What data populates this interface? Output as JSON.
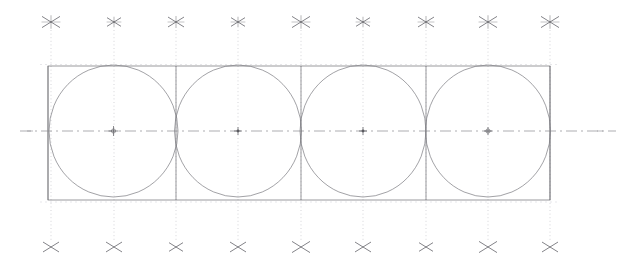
{
  "drawing": {
    "title": "Four Tangent Circles Construction Layout",
    "type": "technical-cad-drawing",
    "canvas": {
      "width": 634,
      "height": 264,
      "background": "#ffffff"
    },
    "colors": {
      "outline": "#6e6e72",
      "circle": "#7a7a80",
      "centerline": "#8a8a90",
      "construction": "#b9b9c0",
      "marker": "#5a5a60",
      "grid_faint": "#cfcfd4"
    },
    "frame": {
      "label": "bounding-rectangle",
      "x": 48,
      "y": 66,
      "width": 502,
      "height": 134,
      "stroke_width": 0.7
    },
    "centerline": {
      "label": "horizontal-axis",
      "y": 131,
      "x_start": 20,
      "x_end": 616,
      "style": "dash-dot",
      "stroke_width": 0.7
    },
    "circles": [
      {
        "label": "circle-1",
        "cx": 113.5,
        "cy": 131,
        "rx": 64.5,
        "ry": 66,
        "stroke_width": 0.7
      },
      {
        "label": "circle-2",
        "cx": 238.0,
        "cy": 131,
        "rx": 63.5,
        "ry": 66,
        "stroke_width": 0.7
      },
      {
        "label": "circle-3",
        "cx": 363.0,
        "cy": 131,
        "rx": 63.0,
        "ry": 66,
        "stroke_width": 0.7
      },
      {
        "label": "circle-4",
        "cx": 488.0,
        "cy": 131,
        "rx": 62.5,
        "ry": 66,
        "stroke_width": 0.7
      }
    ],
    "cell_dividers": [
      {
        "label": "divider-left-edge",
        "x": 48
      },
      {
        "label": "divider-1-2",
        "x": 176
      },
      {
        "label": "divider-2-3",
        "x": 301
      },
      {
        "label": "divider-3-4",
        "x": 426
      },
      {
        "label": "divider-right-edge",
        "x": 550
      }
    ],
    "construction_lines": [
      {
        "label": "construction-line-1",
        "x": 51,
        "y_top": 30,
        "y_bottom": 240,
        "style": "dotted"
      },
      {
        "label": "construction-line-2",
        "x": 114,
        "y_top": 30,
        "y_bottom": 240,
        "style": "dotted"
      },
      {
        "label": "construction-line-3",
        "x": 176,
        "y_top": 30,
        "y_bottom": 240,
        "style": "dotted"
      },
      {
        "label": "construction-line-4",
        "x": 238,
        "y_top": 30,
        "y_bottom": 240,
        "style": "dotted"
      },
      {
        "label": "construction-line-5",
        "x": 301,
        "y_top": 30,
        "y_bottom": 240,
        "style": "dotted"
      },
      {
        "label": "construction-line-6",
        "x": 363,
        "y_top": 30,
        "y_bottom": 240,
        "style": "dotted"
      },
      {
        "label": "construction-line-7",
        "x": 426,
        "y_top": 30,
        "y_bottom": 240,
        "style": "dotted"
      },
      {
        "label": "construction-line-8",
        "x": 488,
        "y_top": 30,
        "y_bottom": 240,
        "style": "dotted"
      },
      {
        "label": "construction-line-9",
        "x": 550,
        "y_top": 30,
        "y_bottom": 240,
        "style": "dotted"
      }
    ],
    "top_markers": [
      {
        "label": "top-marker-1",
        "x": 51,
        "y": 22,
        "size": 9
      },
      {
        "label": "top-marker-2",
        "x": 114,
        "y": 22,
        "size": 7
      },
      {
        "label": "top-marker-3",
        "x": 176,
        "y": 22,
        "size": 8
      },
      {
        "label": "top-marker-4",
        "x": 238,
        "y": 22,
        "size": 7
      },
      {
        "label": "top-marker-5",
        "x": 301,
        "y": 22,
        "size": 9
      },
      {
        "label": "top-marker-6",
        "x": 363,
        "y": 22,
        "size": 7
      },
      {
        "label": "top-marker-7",
        "x": 426,
        "y": 22,
        "size": 8
      },
      {
        "label": "top-marker-8",
        "x": 488,
        "y": 22,
        "size": 9
      },
      {
        "label": "top-marker-9",
        "x": 550,
        "y": 22,
        "size": 9
      }
    ],
    "bottom_markers": [
      {
        "label": "bottom-marker-1",
        "x": 51,
        "y": 247,
        "size": 8
      },
      {
        "label": "bottom-marker-2",
        "x": 114,
        "y": 247,
        "size": 8
      },
      {
        "label": "bottom-marker-3",
        "x": 176,
        "y": 247,
        "size": 7
      },
      {
        "label": "bottom-marker-4",
        "x": 238,
        "y": 247,
        "size": 8
      },
      {
        "label": "bottom-marker-5",
        "x": 301,
        "y": 247,
        "size": 9
      },
      {
        "label": "bottom-marker-6",
        "x": 363,
        "y": 247,
        "size": 8
      },
      {
        "label": "bottom-marker-7",
        "x": 426,
        "y": 247,
        "size": 7
      },
      {
        "label": "bottom-marker-8",
        "x": 488,
        "y": 247,
        "size": 9
      },
      {
        "label": "bottom-marker-9",
        "x": 550,
        "y": 247,
        "size": 8
      }
    ],
    "center_marks": [
      {
        "label": "center-mark-1",
        "cx": 113.5,
        "cy": 131,
        "arm": 5,
        "ring": true
      },
      {
        "label": "center-mark-2",
        "cx": 238.0,
        "cy": 131,
        "arm": 4,
        "ring": false
      },
      {
        "label": "center-mark-3",
        "cx": 363.0,
        "cy": 131,
        "arm": 4,
        "ring": false
      },
      {
        "label": "center-mark-4",
        "cx": 488.0,
        "cy": 131,
        "arm": 4,
        "ring": true
      }
    ],
    "axis_tick_marks": [
      {
        "label": "axis-tick-left-outer",
        "x": 30,
        "y": 131
      },
      {
        "label": "axis-tick-right-outer",
        "x": 600,
        "y": 131
      }
    ]
  }
}
